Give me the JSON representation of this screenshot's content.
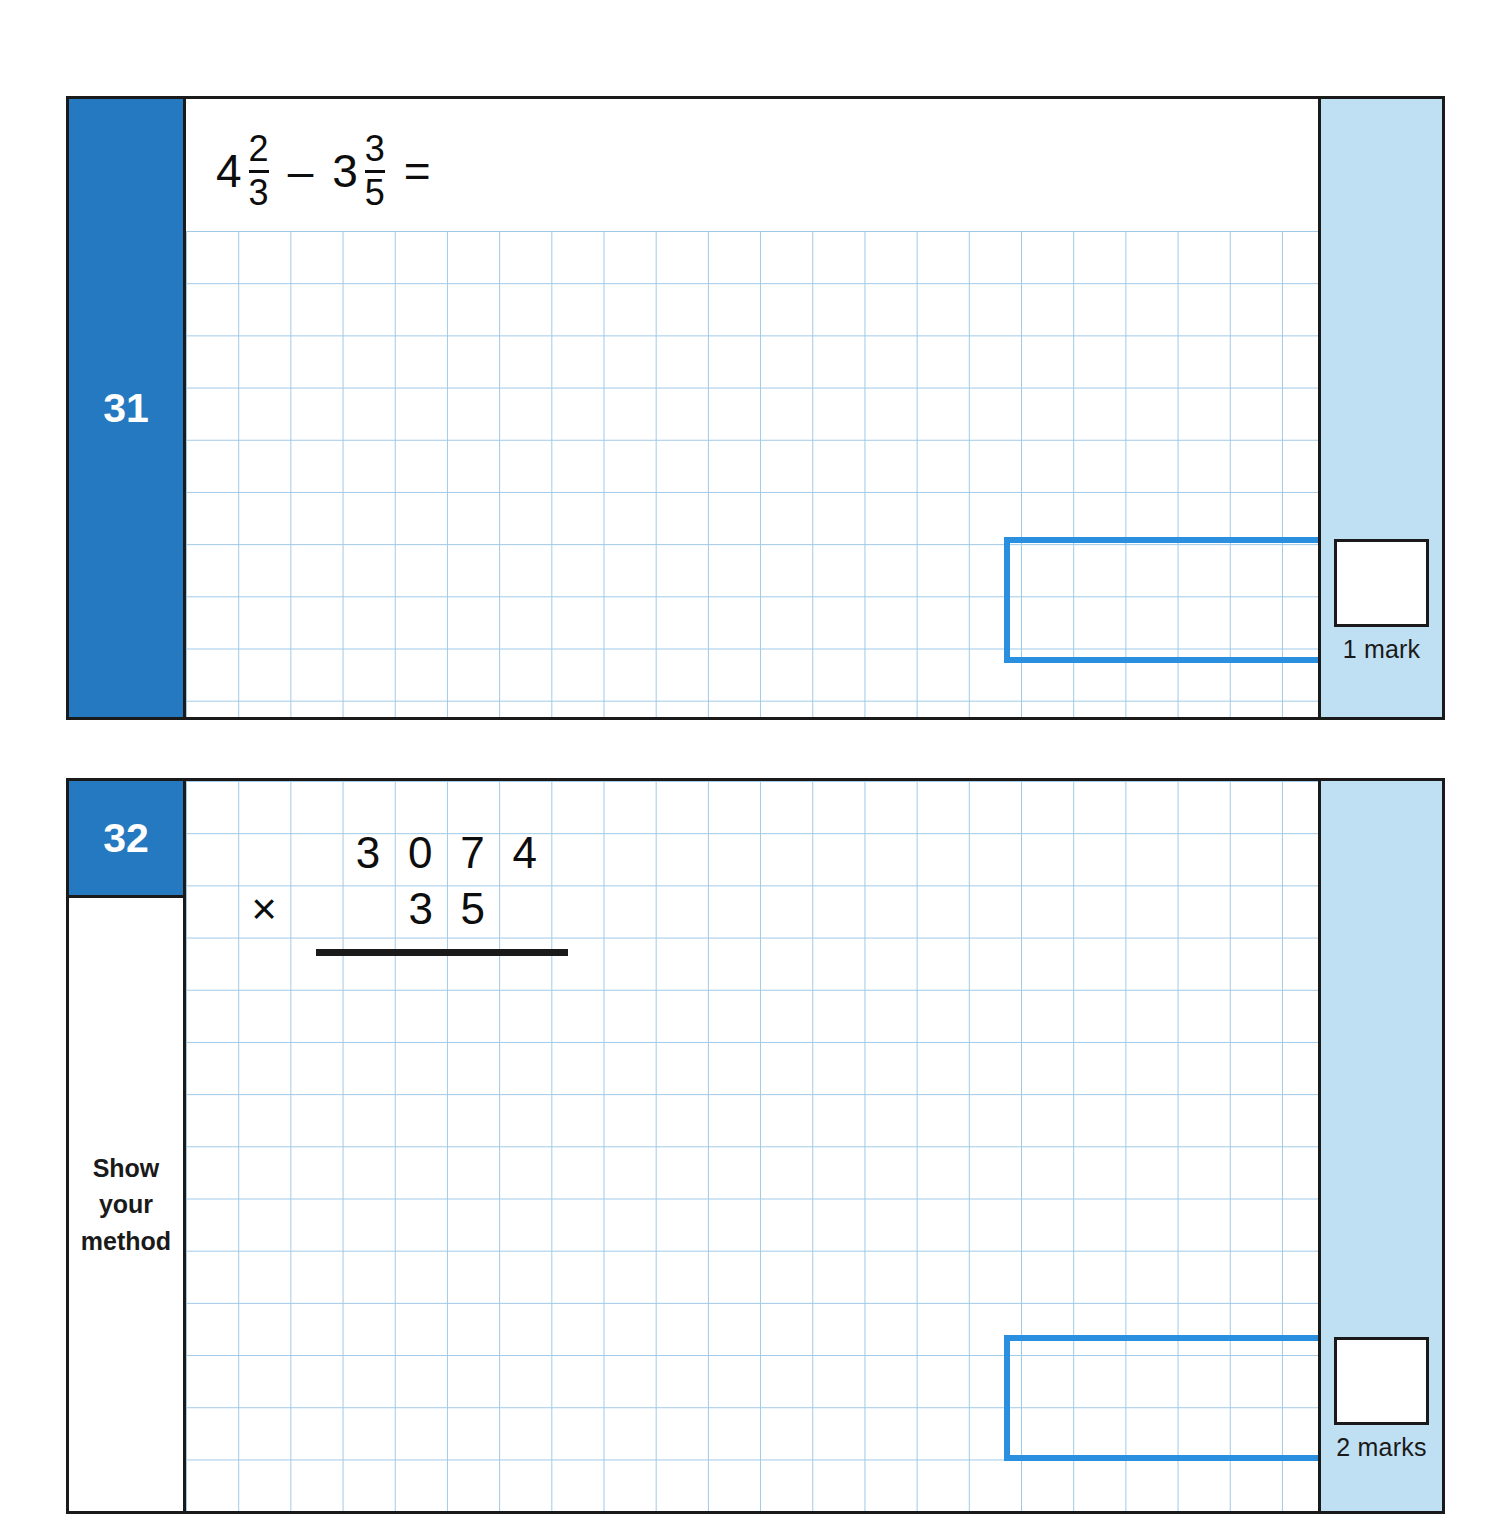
{
  "page": {
    "background_color": "#ffffff",
    "accent_blue": "#2579c0",
    "marks_band_blue": "#bfdff2",
    "answer_box_blue": "#2b8fe0",
    "grid_line_color": "#9fc9e8",
    "frame_color": "#1a1a1a"
  },
  "questions": [
    {
      "number": "31",
      "prompt": {
        "type": "fraction-subtraction",
        "left": {
          "whole": "4",
          "numerator": "2",
          "denominator": "3"
        },
        "operator": "–",
        "right": {
          "whole": "3",
          "numerator": "3",
          "denominator": "5"
        },
        "equals": "=",
        "plain_text": "4 2/3 – 3 3/5 ="
      },
      "answer_box": {
        "value": "",
        "placeholder": ""
      },
      "marks": {
        "label": "1 mark",
        "score_value": ""
      }
    },
    {
      "number": "32",
      "side_label": {
        "line1": "Show",
        "line2": "your",
        "line3": "method"
      },
      "prompt": {
        "type": "long-multiplication",
        "multiplicand": "3074",
        "multiplicand_digits": [
          "3",
          "0",
          "7",
          "4"
        ],
        "operator": "×",
        "multiplier": "35",
        "multiplier_digits": [
          "3",
          "5"
        ],
        "plain_text": "3074 × 35"
      },
      "answer_box": {
        "value": "",
        "placeholder": ""
      },
      "marks": {
        "label": "2 marks",
        "score_value": ""
      }
    }
  ]
}
